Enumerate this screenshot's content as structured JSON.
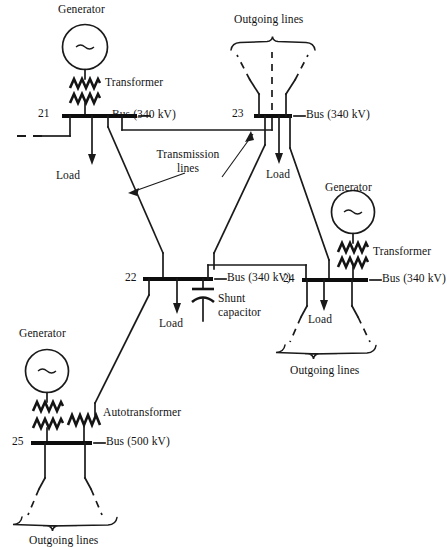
{
  "diagram": {
    "buses": [
      {
        "id": "21",
        "number": "21",
        "label": "Bus (340 kV)",
        "voltage": "340 kV"
      },
      {
        "id": "23",
        "number": "23",
        "label": "Bus (340 kV)",
        "voltage": "340 kV"
      },
      {
        "id": "22",
        "number": "22",
        "label": "Bus (340 kV)",
        "voltage": "340 kV"
      },
      {
        "id": "24",
        "number": "24",
        "label": "Bus (340 kV)",
        "voltage": "340 kV"
      },
      {
        "id": "25",
        "number": "25",
        "label": "Bus (500 kV)",
        "voltage": "500 kV"
      }
    ],
    "generators": [
      {
        "id": "gen-21",
        "label": "Generator",
        "symbol": "~"
      },
      {
        "id": "gen-24",
        "label": "Generator",
        "symbol": "~"
      },
      {
        "id": "gen-25",
        "label": "Generator",
        "symbol": "~"
      }
    ],
    "transformers": [
      {
        "id": "xfmr-21",
        "label": "Transformer"
      },
      {
        "id": "xfmr-24",
        "label": "Transformer"
      }
    ],
    "autotransformer": {
      "id": "autoxfmr-25",
      "label": "Autotransformer"
    },
    "loads": [
      {
        "id": "load-21",
        "label": "Load"
      },
      {
        "id": "load-23",
        "label": "Load"
      },
      {
        "id": "load-22",
        "label": "Load"
      },
      {
        "id": "load-24",
        "label": "Load"
      }
    ],
    "shunt_capacitor": {
      "id": "cap-22",
      "label_line1": "Shunt",
      "label_line2": "capacitor"
    },
    "transmission_lines_label": {
      "line1": "Transmission",
      "line2": "lines"
    },
    "outgoing_lines": [
      {
        "id": "outgoing-23",
        "label": "Outgoing lines",
        "position": "top"
      },
      {
        "id": "outgoing-24",
        "label": "Outgoing lines",
        "position": "right-bottom"
      },
      {
        "id": "outgoing-25",
        "label": "Outgoing lines",
        "position": "bottom-left"
      }
    ],
    "colors": {
      "line": "#1a1a1a",
      "bus": "#0d0d0d",
      "background": "#ffffff",
      "text": "#131313"
    }
  }
}
